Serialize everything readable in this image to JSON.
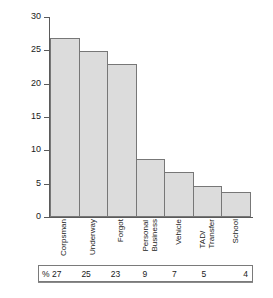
{
  "chart_data": {
    "type": "bar",
    "title": "",
    "subtitle": "",
    "xlabel": "",
    "ylabel": "% of failed appointments",
    "ylim": [
      0,
      30
    ],
    "ytick_labels": [
      "0",
      "5",
      "10",
      "15",
      "20",
      "25",
      "30"
    ],
    "ytick_values": [
      0,
      5,
      10,
      15,
      20,
      25,
      30
    ],
    "grid": false,
    "legend": null,
    "categories": [
      "Corpsman",
      "Underway",
      "Forgot",
      "Personal Business",
      "Vehicle",
      "TAD/ Transfer",
      "School"
    ],
    "category_lines": [
      [
        "Corpsman"
      ],
      [
        "Underway"
      ],
      [
        "Forgot"
      ],
      [
        "Personal",
        "Business"
      ],
      [
        "Vehicle"
      ],
      [
        "TAD/",
        "Transfer"
      ],
      [
        "School"
      ]
    ],
    "values": [
      26.9,
      24.9,
      22.9,
      8.7,
      6.7,
      4.7,
      3.7
    ],
    "bar_color": "#dcdcdc",
    "bar_edge_color": "#777777",
    "axis_color": "#5a5a5a"
  },
  "table": {
    "row_label": "%",
    "cells": [
      "% 27",
      "25",
      "23",
      "9",
      "7",
      "5",
      "4"
    ],
    "values": [
      27,
      25,
      23,
      9,
      7,
      5,
      4
    ],
    "border_color": "#7a7a7a"
  }
}
